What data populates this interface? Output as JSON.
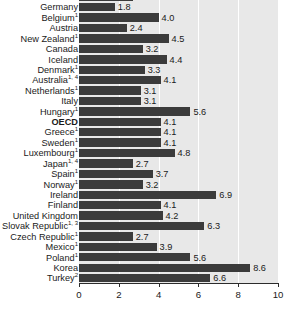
{
  "chart_data": {
    "type": "bar",
    "orientation": "horizontal",
    "title": "",
    "subtitle": "",
    "xlabel": "",
    "ylabel": "",
    "xlim": [
      0,
      10
    ],
    "xticks": [
      0,
      2,
      4,
      6,
      8,
      10
    ],
    "xtick_labels": [
      "0",
      "2",
      "4",
      "6",
      "8",
      "10"
    ],
    "grid": true,
    "grid_axis": "x",
    "legend": null,
    "clipped_top_row": true,
    "categories": [
      "Switzerland",
      "Germany",
      "Belgium",
      "Austria",
      "New Zealand",
      "Canada",
      "Iceland",
      "Denmark",
      "Australia",
      "Netherlands",
      "Italy",
      "Hungary",
      "OECD",
      "Greece",
      "Sweden",
      "Luxembourg",
      "Japan",
      "Spain",
      "Norway",
      "Ireland",
      "Finland",
      "United Kingdom",
      "Slovak Republic",
      "Czech Republic",
      "Mexico",
      "Poland",
      "Korea",
      "Turkey"
    ],
    "values": [
      2.7,
      1.8,
      4.0,
      2.4,
      4.5,
      3.2,
      4.4,
      3.3,
      4.1,
      3.1,
      3.1,
      5.6,
      4.1,
      4.1,
      4.1,
      4.8,
      2.7,
      3.7,
      3.2,
      6.9,
      4.1,
      4.2,
      6.3,
      2.7,
      3.9,
      5.6,
      8.6,
      6.6
    ],
    "value_labels": [
      "2.7",
      "1.8",
      "4.0",
      "2.4",
      "4.5",
      "3.2",
      "4.4",
      "3.3",
      "4.1",
      "3.1",
      "3.1",
      "5.6",
      "4.1",
      "4.1",
      "4.1",
      "4.8",
      "2.7",
      "3.7",
      "3.2",
      "6.9",
      "4.1",
      "4.2",
      "6.3",
      "2.7",
      "3.9",
      "5.6",
      "8.6",
      "6.6"
    ],
    "footnote_markers": [
      "",
      "",
      "1",
      "",
      "1",
      "",
      "",
      "1",
      "1, 4",
      "1",
      "",
      "1",
      "",
      "1",
      "1",
      "1",
      "1, 4",
      "1",
      "1",
      "",
      "",
      "",
      "1, 3",
      "1",
      "1",
      "1",
      "",
      "2"
    ],
    "highlighted_category": "OECD"
  },
  "style": {
    "bar_color": "#3b3b3b",
    "plot_background": "#e8e8e8",
    "gridline_color": "#ffffff",
    "axis_color": "#2b2b2b",
    "text_color": "#1a1a1a",
    "page_background": "#ffffff"
  }
}
